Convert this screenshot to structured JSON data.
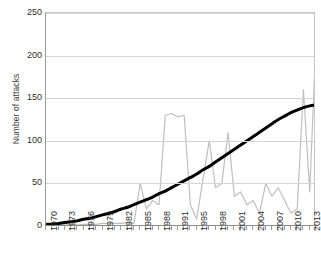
{
  "chart_data": {
    "type": "line",
    "title": "",
    "xlabel": "",
    "ylabel": "Number of attacks",
    "ylim": [
      0,
      250
    ],
    "yticks": [
      0,
      50,
      100,
      150,
      200,
      250
    ],
    "xlim": [
      1970,
      2013
    ],
    "grid": true,
    "legend": "none",
    "xtick_labels": [
      "1970",
      "1973",
      "1976",
      "1979",
      "1982",
      "1985",
      "1988",
      "1991",
      "1995",
      "1998",
      "2001",
      "2004",
      "2007",
      "2010",
      "2013"
    ],
    "xtick_years": [
      1970,
      1973,
      1976,
      1979,
      1982,
      1985,
      1988,
      1991,
      1994,
      1997,
      2000,
      2003,
      2006,
      2009,
      2012
    ],
    "x": [
      1970,
      1971,
      1972,
      1973,
      1974,
      1975,
      1976,
      1977,
      1978,
      1979,
      1980,
      1981,
      1982,
      1983,
      1984,
      1985,
      1986,
      1987,
      1988,
      1989,
      1990,
      1991,
      1992,
      1993,
      1994,
      1995,
      1996,
      1997,
      1998,
      1999,
      2000,
      2001,
      2002,
      2003,
      2004,
      2005,
      2006,
      2007,
      2008,
      2009,
      2010,
      2011,
      2012,
      2013
    ],
    "series": [
      {
        "name": "Annual number of attacks",
        "color": "#bfbfbf",
        "style": "jagged",
        "values": [
          2,
          1,
          1,
          1,
          2,
          1,
          2,
          2,
          2,
          3,
          3,
          3,
          3,
          4,
          3,
          50,
          20,
          30,
          25,
          130,
          132,
          128,
          130,
          25,
          8,
          55,
          100,
          45,
          50,
          110,
          35,
          40,
          25,
          30,
          15,
          50,
          35,
          45,
          30,
          15,
          20,
          160,
          40,
          220
        ]
      },
      {
        "name": "Trend",
        "color": "#000000",
        "style": "smooth",
        "values": [
          2,
          2,
          3,
          4,
          5,
          6,
          8,
          9,
          11,
          13,
          15,
          17,
          20,
          22,
          25,
          28,
          31,
          34,
          38,
          41,
          45,
          49,
          53,
          57,
          61,
          66,
          70,
          75,
          80,
          85,
          90,
          95,
          100,
          105,
          110,
          115,
          120,
          125,
          129,
          133,
          136,
          139,
          141,
          142
        ]
      }
    ]
  }
}
